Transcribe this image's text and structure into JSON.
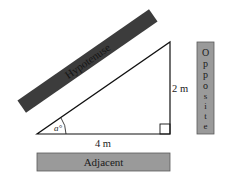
{
  "diagram": {
    "colors": {
      "hypotenuse_bar": "#3c3c3c",
      "hypotenuse_text": "#151515",
      "side_bar": "#9a9a9a",
      "side_bar_border": "#5a5a5a",
      "triangle_stroke": "#111111"
    },
    "labels": {
      "hypotenuse": "Hypotenuse",
      "opposite": "Opposite",
      "adjacent": "Adjacent",
      "opposite_letters": [
        "O",
        "p",
        "p",
        "o",
        "s",
        "i",
        "t",
        "e"
      ],
      "adjacent_length": "4 m",
      "opposite_length": "2 m",
      "angle": "a°"
    },
    "triangle": {
      "vertices": {
        "angle_vertex": [
          37,
          134
        ],
        "right_angle_vertex": [
          170,
          134
        ],
        "top_vertex": [
          170,
          42
        ]
      },
      "right_angle_marker": true,
      "angle_arc": true
    }
  }
}
